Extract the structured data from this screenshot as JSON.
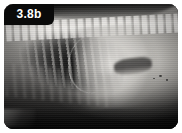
{
  "figure": {
    "label": "3.8b",
    "modality": "radiograph",
    "view": "lateral",
    "border_color": "#ffffff",
    "frame_color": "#0a0a0a",
    "label_text_color": "#ffffff",
    "label_background": "#0a0a0a"
  },
  "anatomy": [
    {
      "name": "vertebral-column",
      "appearance": "bright segmented band across the dorsal margin"
    },
    {
      "name": "rib-cage",
      "appearance": "oblique bright striations over the cranial thorax"
    },
    {
      "name": "lung-field",
      "appearance": "dark radiolucent wedge beneath the spine"
    },
    {
      "name": "diaphragm",
      "appearance": "curved bright boundary at mid image"
    },
    {
      "name": "abdominal-mass",
      "appearance": "large homogeneous radiopaque region on the right"
    },
    {
      "name": "gas-filled-viscus",
      "appearance": "darker loop within the abdominal soft tissue"
    },
    {
      "name": "ventral-body-wall",
      "appearance": "faint streaks along the lower left"
    }
  ]
}
